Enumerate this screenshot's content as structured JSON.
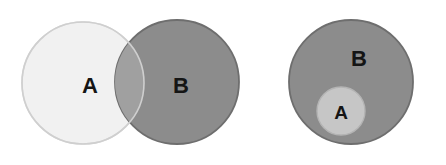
{
  "figure": {
    "background_color": "#ffffff",
    "width": 446,
    "height": 165
  },
  "palette": {
    "set_a_light_fill": "#f1f1f1",
    "set_a_light_stroke": "#dcdcdc",
    "set_b_gray_fill": "#8c8c8c",
    "set_b_gray_stroke": "#6e6e6e",
    "intersection_fill": "#a0a0a0",
    "inner_set_a_fill": "#c6c6c6",
    "inner_set_a_stroke": "#b4b4b4",
    "label_color": "#151515"
  },
  "panels": [
    {
      "id": "overlap-panel",
      "name": "partial-overlap-venn",
      "relationship": "A and B partially overlap (intersection)",
      "shapes": [
        {
          "id": "left-circle-a",
          "set": "A",
          "cx": 83,
          "cy": 83,
          "r": 61,
          "fill": "#f1f1f1",
          "stroke": "#dcdcdc"
        },
        {
          "id": "left-circle-b",
          "set": "B",
          "cx": 177,
          "cy": 82,
          "r": 62,
          "fill": "#8c8c8c",
          "stroke": "#6e6e6e"
        }
      ],
      "labels": [
        {
          "id": "label-a-left",
          "text": "A",
          "x": 90,
          "y": 85,
          "font_size": 22
        },
        {
          "id": "label-b-left",
          "text": "B",
          "x": 181,
          "y": 85,
          "font_size": 22
        }
      ]
    },
    {
      "id": "subset-panel",
      "name": "subset-venn",
      "relationship": "A is a subset of B (A contained inside B)",
      "shapes": [
        {
          "id": "right-circle-b",
          "set": "B",
          "cx": 351,
          "cy": 82,
          "r": 62,
          "fill": "#8c8c8c",
          "stroke": "#6e6e6e"
        },
        {
          "id": "right-circle-a",
          "set": "A",
          "cx": 341,
          "cy": 111,
          "r": 24,
          "fill": "#c6c6c6",
          "stroke": "#b4b4b4"
        }
      ],
      "labels": [
        {
          "id": "label-b-right",
          "text": "B",
          "x": 359,
          "y": 58,
          "font_size": 22
        },
        {
          "id": "label-a-right",
          "text": "A",
          "x": 341,
          "y": 112,
          "font_size": 19
        }
      ]
    }
  ],
  "chart_data": {
    "type": "diagram",
    "diagram_type": "venn",
    "xlabel": "",
    "ylabel": "",
    "legend": [],
    "sets": [
      "A",
      "B"
    ],
    "panels": [
      {
        "label": "partial overlap",
        "regions": [
          "A only",
          "A ∩ B",
          "B only"
        ],
        "set_sizes": {
          "A": 61,
          "B": 62
        },
        "overlap": true,
        "subset": false
      },
      {
        "label": "subset",
        "regions": [
          "A (inside B)",
          "B only"
        ],
        "set_sizes": {
          "A": 24,
          "B": 62
        },
        "overlap": true,
        "subset": true
      }
    ]
  }
}
